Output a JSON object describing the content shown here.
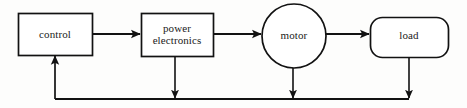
{
  "diagram": {
    "stroke_color": "#121212",
    "background_color": "#fdfdfc",
    "nodes": [
      {
        "id": "control",
        "label": "control",
        "shape": "rectangle",
        "x": 18,
        "y": 13,
        "width": 74,
        "height": 42
      },
      {
        "id": "power-electronics",
        "label": "power\nelectronics",
        "shape": "rectangle",
        "x": 141,
        "y": 13,
        "width": 72,
        "height": 43
      },
      {
        "id": "motor",
        "label": "motor",
        "shape": "circle",
        "cx": 294,
        "cy": 36,
        "r": 32
      },
      {
        "id": "load",
        "label": "load",
        "shape": "rounded-rectangle",
        "x": 370,
        "y": 17,
        "width": 78,
        "height": 40,
        "corner_radius": 12
      }
    ],
    "forward_arrows": [
      {
        "id": "control-to-power-electronics",
        "from": "control",
        "to": "power-electronics",
        "x1": 92,
        "y1": 34,
        "x2": 141,
        "y2": 34
      },
      {
        "id": "power-electronics-to-motor",
        "from": "power-electronics",
        "to": "motor",
        "x1": 213,
        "y1": 34,
        "x2": 262,
        "y2": 34
      },
      {
        "id": "motor-to-load",
        "from": "motor",
        "to": "load",
        "x1": 326,
        "y1": 34,
        "x2": 370,
        "y2": 34
      }
    ],
    "feedback_bus": {
      "id": "feedback-bus",
      "y": 99,
      "x_left": 55,
      "x_right": 409,
      "taps": [
        {
          "id": "tap-power-electronics",
          "x": 175,
          "from_y": 56,
          "to_y": 99,
          "direction": "down"
        },
        {
          "id": "tap-motor",
          "x": 293,
          "from_y": 68,
          "to_y": 99,
          "direction": "down"
        },
        {
          "id": "tap-load",
          "x": 409,
          "from_y": 57,
          "to_y": 99,
          "direction": "down"
        }
      ],
      "return_arrow": {
        "id": "feedback-to-control",
        "x": 55,
        "from_y": 99,
        "to_y": 55,
        "direction": "up"
      }
    }
  }
}
